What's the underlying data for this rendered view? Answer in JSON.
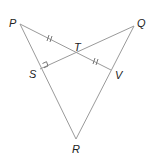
{
  "diagram": {
    "type": "geometry-figure",
    "points": {
      "P": {
        "label": "P",
        "x": 20,
        "y": 24
      },
      "Q": {
        "label": "Q",
        "x": 134,
        "y": 26
      },
      "R": {
        "label": "R",
        "x": 76,
        "y": 139
      },
      "S": {
        "label": "S",
        "x": 40,
        "y": 69
      },
      "T": {
        "label": "T",
        "x": 77,
        "y": 53
      },
      "V": {
        "label": "V",
        "x": 111,
        "y": 70
      }
    },
    "segments": [
      "PR",
      "QR",
      "PV",
      "QS"
    ],
    "markings": {
      "congruent_ticks": [
        "PT",
        "TV"
      ],
      "right_angle_at": "S"
    }
  }
}
